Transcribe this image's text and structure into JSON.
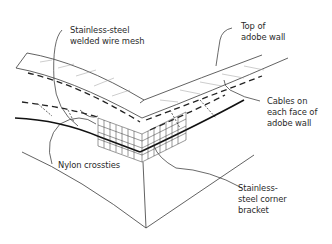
{
  "diagram": {
    "type": "isometric-construction-detail",
    "labels": [
      {
        "id": "mesh",
        "text": "Stainless-steel\nwelded wire mesh"
      },
      {
        "id": "top",
        "text": "Top of\nadobe wall"
      },
      {
        "id": "cables",
        "text": "Cables on\neach face of\nadobe wall"
      },
      {
        "id": "crossties",
        "text": "Nylon crossties"
      },
      {
        "id": "bracket",
        "text": "Stainless-\nsteel corner\nbracket"
      }
    ],
    "colors": {
      "background": "#ffffff",
      "line": "#3a3a3a",
      "text": "#2a2a2a"
    }
  }
}
